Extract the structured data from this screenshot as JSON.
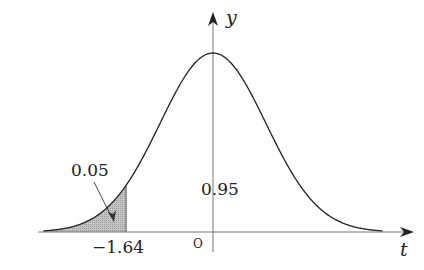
{
  "chart_data": {
    "type": "area",
    "title": "",
    "xlabel": "t",
    "ylabel": "y",
    "origin_label": "O",
    "distribution": {
      "mean": 0,
      "sd": 1
    },
    "x_range": [
      -3.2,
      3.2
    ],
    "shaded_region": {
      "from": "-inf",
      "to": -1.64,
      "area": 0.05
    },
    "tick_labels": [
      "-1.64"
    ],
    "annotations": [
      {
        "text": "0.05",
        "target": "shaded left tail",
        "arrow": true
      },
      {
        "text": "0.95",
        "target": "unshaded area under curve"
      }
    ],
    "grid": false,
    "legend": null
  },
  "labels": {
    "y_axis": "y",
    "x_axis": "t",
    "origin": "O",
    "critical_value": "−1.64",
    "tail_area": "0.05",
    "body_area": "0.95"
  },
  "colors": {
    "curve": "#222222",
    "axis": "#555555",
    "shade": "#b5b5b5"
  }
}
